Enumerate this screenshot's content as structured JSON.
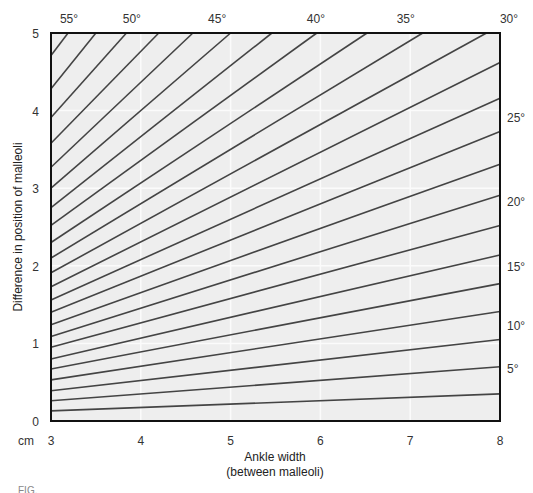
{
  "chart_data": {
    "type": "line",
    "title": "",
    "xlabel": "Ankle width",
    "xlabel_line2": "(between malleoli)",
    "ylabel": "Difference in position of malleoli",
    "unit_label": "cm",
    "xlim": [
      3,
      8
    ],
    "ylim": [
      0,
      5
    ],
    "x_ticks": [
      3,
      4,
      5,
      6,
      7,
      8
    ],
    "y_ticks": [
      0,
      1,
      2,
      3,
      4,
      5
    ],
    "grid": true,
    "legend": "none",
    "angles_deg": [
      2.5,
      5,
      7.5,
      10,
      12.5,
      15,
      17.5,
      20,
      22.5,
      25,
      27.5,
      30,
      32.5,
      35,
      37.5,
      40,
      42.5,
      45,
      47.5,
      50,
      52.5,
      55,
      57.5
    ],
    "series": [
      {
        "name": "2.5°",
        "x": [
          3,
          8
        ],
        "values": [
          0.13,
          0.35
        ]
      },
      {
        "name": "5°",
        "x": [
          3,
          8
        ],
        "values": [
          0.26,
          0.7
        ]
      },
      {
        "name": "7.5°",
        "x": [
          3,
          8
        ],
        "values": [
          0.39,
          1.05
        ]
      },
      {
        "name": "10°",
        "x": [
          3,
          8
        ],
        "values": [
          0.53,
          1.41
        ]
      },
      {
        "name": "12.5°",
        "x": [
          3,
          8
        ],
        "values": [
          0.67,
          1.77
        ]
      },
      {
        "name": "15°",
        "x": [
          3,
          8
        ],
        "values": [
          0.8,
          2.14
        ]
      },
      {
        "name": "17.5°",
        "x": [
          3,
          8
        ],
        "values": [
          0.95,
          2.52
        ]
      },
      {
        "name": "20°",
        "x": [
          3,
          8
        ],
        "values": [
          1.09,
          2.91
        ]
      },
      {
        "name": "22.5°",
        "x": [
          3,
          8
        ],
        "values": [
          1.24,
          3.31
        ]
      },
      {
        "name": "25°",
        "x": [
          3,
          8
        ],
        "values": [
          1.4,
          3.73
        ]
      },
      {
        "name": "27.5°",
        "x": [
          3,
          8
        ],
        "values": [
          1.56,
          4.16
        ]
      },
      {
        "name": "30°",
        "x": [
          3,
          8
        ],
        "values": [
          1.73,
          4.62
        ]
      },
      {
        "name": "32.5°",
        "x": [
          3,
          7.85
        ],
        "values": [
          1.91,
          5.0
        ]
      },
      {
        "name": "35°",
        "x": [
          3,
          7.14
        ],
        "values": [
          2.1,
          5.0
        ]
      },
      {
        "name": "37.5°",
        "x": [
          3,
          6.52
        ],
        "values": [
          2.3,
          5.0
        ]
      },
      {
        "name": "40°",
        "x": [
          3,
          5.96
        ],
        "values": [
          2.52,
          5.0
        ]
      },
      {
        "name": "42.5°",
        "x": [
          3,
          5.46
        ],
        "values": [
          2.75,
          5.0
        ]
      },
      {
        "name": "45°",
        "x": [
          3,
          5.0
        ],
        "values": [
          3.0,
          5.0
        ]
      },
      {
        "name": "47.5°",
        "x": [
          3,
          4.58
        ],
        "values": [
          3.27,
          5.0
        ]
      },
      {
        "name": "50°",
        "x": [
          3,
          4.2
        ],
        "values": [
          3.58,
          5.0
        ]
      },
      {
        "name": "52.5°",
        "x": [
          3,
          3.84
        ],
        "values": [
          3.91,
          5.0
        ]
      },
      {
        "name": "55°",
        "x": [
          3,
          3.5
        ],
        "values": [
          4.28,
          5.0
        ]
      },
      {
        "name": "57.5°",
        "x": [
          3,
          3.19
        ],
        "values": [
          4.71,
          5.0
        ]
      }
    ],
    "top_angle_labels": [
      {
        "label": "55°",
        "x": 3.2
      },
      {
        "label": "50°",
        "x": 3.9
      },
      {
        "label": "45°",
        "x": 4.85
      },
      {
        "label": "40°",
        "x": 5.95
      },
      {
        "label": "35°",
        "x": 6.95
      },
      {
        "label": "30°",
        "x": 8.1
      }
    ],
    "right_angle_labels": [
      {
        "label": "25°",
        "y": 3.92
      },
      {
        "label": "20°",
        "y": 2.83
      },
      {
        "label": "15°",
        "y": 2.0
      },
      {
        "label": "10°",
        "y": 1.24
      },
      {
        "label": "5°",
        "y": 0.68
      }
    ]
  },
  "caption": {
    "visible_text": "FIG."
  },
  "colors": {
    "plot_background": "#eeeeee",
    "grid": "#fbfbfb",
    "line": "#444444",
    "frame": "#111111"
  }
}
